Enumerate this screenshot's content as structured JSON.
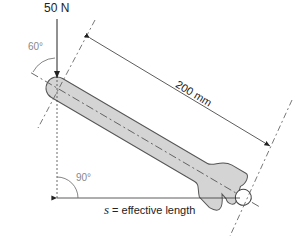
{
  "diagram": {
    "force": {
      "label": "50 N"
    },
    "angle_top": {
      "label": "60°"
    },
    "angle_bottom": {
      "label": "90°"
    },
    "dimension": {
      "label": "200 mm"
    },
    "effective_length": {
      "symbol": "s",
      "label": " = effective length"
    },
    "colors": {
      "wrench_fill": "#d4d4d4",
      "line": "#333333",
      "angle_text": "#888888"
    }
  }
}
